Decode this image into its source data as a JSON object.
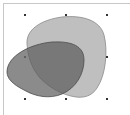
{
  "canvas": {
    "background": "#ffffff",
    "frame_color": "#c8c8c8"
  },
  "shapes": [
    {
      "name": "light-blob",
      "fill": "#b4b4b4",
      "fill_opacity": 0.85,
      "stroke": "#8a8a8a"
    },
    {
      "name": "dark-ellipse",
      "fill": "#5a5a5a",
      "fill_opacity": 0.7,
      "stroke": "#4a4a4a"
    }
  ],
  "selection": {
    "handle_color": "#333333",
    "handles": [
      {
        "pos": "top-left",
        "x": 25,
        "y": 15
      },
      {
        "pos": "top-center",
        "x": 66,
        "y": 15
      },
      {
        "pos": "top-right",
        "x": 107,
        "y": 15
      },
      {
        "pos": "middle-left",
        "x": 25,
        "y": 57
      },
      {
        "pos": "middle-right",
        "x": 107,
        "y": 57
      },
      {
        "pos": "bottom-left",
        "x": 25,
        "y": 99
      },
      {
        "pos": "bottom-center",
        "x": 66,
        "y": 99
      },
      {
        "pos": "bottom-right",
        "x": 107,
        "y": 99
      }
    ]
  }
}
